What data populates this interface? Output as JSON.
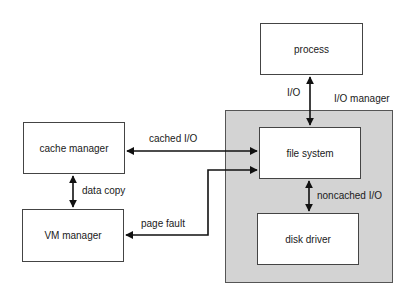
{
  "diagram": {
    "regions": {
      "io_manager": {
        "label": "I/O manager",
        "fill": "#d3d3d3"
      }
    },
    "nodes": {
      "process": "process",
      "file_system": "file system",
      "disk_driver": "disk driver",
      "cache_manager": "cache manager",
      "vm_manager": "VM manager"
    },
    "edges": {
      "process_fs": {
        "from": "process",
        "to": "file system",
        "label": "I/O",
        "direction": "bidirectional"
      },
      "cache_fs": {
        "from": "cache manager",
        "to": "file system",
        "label": "cached I/O",
        "direction": "bidirectional"
      },
      "cache_vm": {
        "from": "cache manager",
        "to": "VM manager",
        "label": "data copy",
        "direction": "bidirectional"
      },
      "vm_fs": {
        "from": "VM manager",
        "to": "file system",
        "label": "page fault",
        "direction": "bidirectional"
      },
      "fs_disk": {
        "from": "file system",
        "to": "disk driver",
        "label": "noncached I/O",
        "direction": "bidirectional"
      }
    }
  }
}
